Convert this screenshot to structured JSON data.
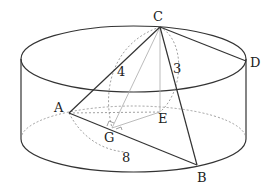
{
  "diagram": {
    "type": "geometry-cylinder-pyramid",
    "colors": {
      "stroke": "#333333",
      "hidden": "#888888",
      "aux": "#aaaaaa"
    },
    "points": {
      "C": {
        "label": "C",
        "x": 160,
        "y": 27
      },
      "D": {
        "label": "D",
        "x": 246,
        "y": 61
      },
      "A": {
        "label": "A",
        "x": 69,
        "y": 113
      },
      "B": {
        "label": "B",
        "x": 197,
        "y": 165
      },
      "E": {
        "label": "E",
        "x": 160,
        "y": 112
      },
      "G": {
        "label": "G",
        "x": 112,
        "y": 128
      }
    },
    "lengths": {
      "CA": "4",
      "CB": "3",
      "AB": "8"
    }
  }
}
